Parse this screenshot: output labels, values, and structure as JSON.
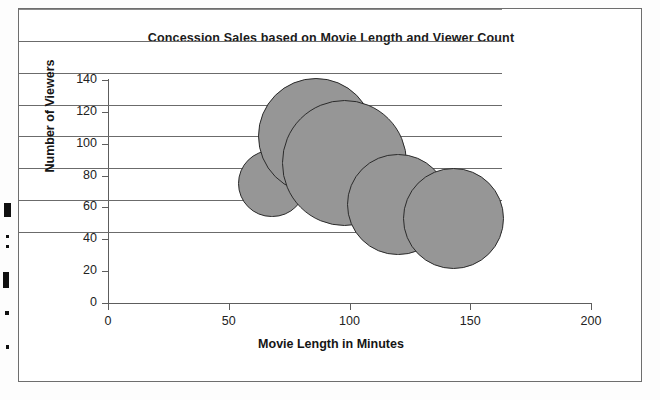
{
  "chart_data": {
    "type": "scatter",
    "subtype": "bubble",
    "title": "Concession Sales based on Movie Length and Viewer Count",
    "xlabel": "Movie Length in Minutes",
    "ylabel": "Number of Viewers",
    "xlim": [
      0,
      200
    ],
    "ylim": [
      0,
      140
    ],
    "xticks": [
      0,
      50,
      100,
      150,
      200
    ],
    "yticks": [
      0,
      20,
      40,
      60,
      80,
      100,
      120,
      140
    ],
    "xtick_labels": [
      "0",
      "50",
      "100",
      "150",
      "200"
    ],
    "ytick_labels": [
      "0",
      "20",
      "40",
      "60",
      "80",
      "100",
      "120",
      "140"
    ],
    "grid": "horizontal",
    "legend": "none",
    "series_name": "Concession Sales",
    "bubble_color": "#969696",
    "bubble_edge_color": "#2b2b2b",
    "gridline_color": "#6b6b6b",
    "points": [
      {
        "label": "bubble-1",
        "x": 68,
        "y": 75,
        "size": 28
      },
      {
        "label": "bubble-2",
        "x": 86,
        "y": 105,
        "size": 48
      },
      {
        "label": "bubble-3",
        "x": 98,
        "y": 88,
        "size": 52
      },
      {
        "label": "bubble-4",
        "x": 120,
        "y": 62,
        "size": 42
      },
      {
        "label": "bubble-5",
        "x": 143,
        "y": 53,
        "size": 42
      }
    ]
  },
  "artifacts": {
    "specks": [
      {
        "x": 4,
        "y": 203,
        "w": 7,
        "h": 14
      },
      {
        "x": 6,
        "y": 235,
        "w": 3,
        "h": 3
      },
      {
        "x": 6,
        "y": 245,
        "w": 3,
        "h": 3
      },
      {
        "x": 3,
        "y": 272,
        "w": 6,
        "h": 16
      },
      {
        "x": 5,
        "y": 311,
        "w": 4,
        "h": 4
      },
      {
        "x": 6,
        "y": 345,
        "w": 3,
        "h": 4
      }
    ]
  }
}
